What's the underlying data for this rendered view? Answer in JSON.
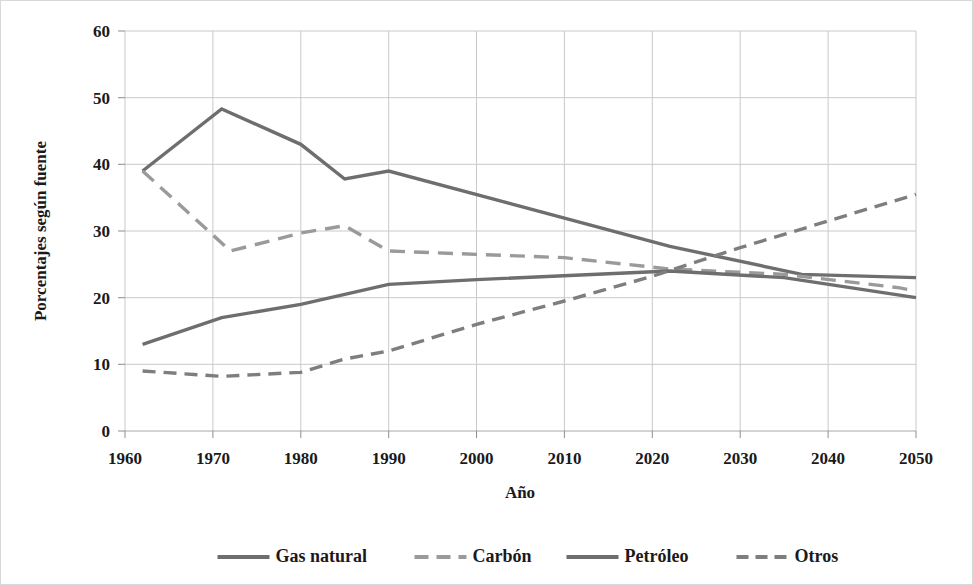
{
  "chart_data": {
    "type": "line",
    "title": "",
    "xlabel": "Año",
    "ylabel": "Porcentajes según fuente",
    "xlim": [
      1960,
      2050
    ],
    "ylim": [
      0,
      60
    ],
    "xticks": [
      1960,
      1970,
      1980,
      1990,
      2000,
      2010,
      2020,
      2030,
      2040,
      2050
    ],
    "yticks": [
      0,
      10,
      20,
      30,
      40,
      50,
      60
    ],
    "grid": true,
    "legend_position": "bottom",
    "series": [
      {
        "name": "Gas natural",
        "style": "solid",
        "color": "#6e6e6e",
        "x": [
          1962,
          1971,
          1980,
          1985,
          1990,
          2022,
          2037,
          2050
        ],
        "values": [
          39,
          48.3,
          43,
          37.8,
          39,
          27.7,
          23.5,
          23
        ]
      },
      {
        "name": "Carbón",
        "style": "dashed",
        "color": "#9a9a9a",
        "x": [
          1962,
          1972,
          1980,
          1985,
          1990,
          2000,
          2010,
          2022,
          2035,
          2048,
          2050
        ],
        "values": [
          39,
          27,
          29.7,
          30.8,
          27,
          26.5,
          26,
          24.3,
          23.5,
          21.5,
          21
        ]
      },
      {
        "name": "Petróleo",
        "style": "solid",
        "color": "#6e6e6e",
        "x": [
          1962,
          1971,
          1980,
          1990,
          2000,
          2022,
          2035,
          2050
        ],
        "values": [
          13,
          17,
          19,
          22,
          22.7,
          24,
          23,
          20
        ]
      },
      {
        "name": "Otros",
        "style": "dashed",
        "color": "#7e7e7e",
        "x": [
          1962,
          1971,
          1980,
          1985,
          1990,
          2000,
          2010,
          2020,
          2030,
          2040,
          2050
        ],
        "values": [
          9,
          8.2,
          8.8,
          10.8,
          12,
          16,
          19.5,
          23.2,
          27.5,
          31.5,
          35.5
        ]
      }
    ]
  },
  "axes": {
    "ylabel": "Porcentajes según fuente",
    "xlabel": "Año",
    "ytick_labels": [
      "60",
      "50",
      "40",
      "30",
      "20",
      "10",
      "0"
    ],
    "xtick_labels": [
      "1960",
      "1970",
      "1980",
      "1990",
      "2000",
      "2010",
      "2020",
      "2030",
      "2040",
      "2050"
    ]
  },
  "legend": {
    "items": [
      {
        "label": "Gas natural"
      },
      {
        "label": "Carbón"
      },
      {
        "label": "Petróleo"
      },
      {
        "label": "Otros"
      }
    ]
  }
}
